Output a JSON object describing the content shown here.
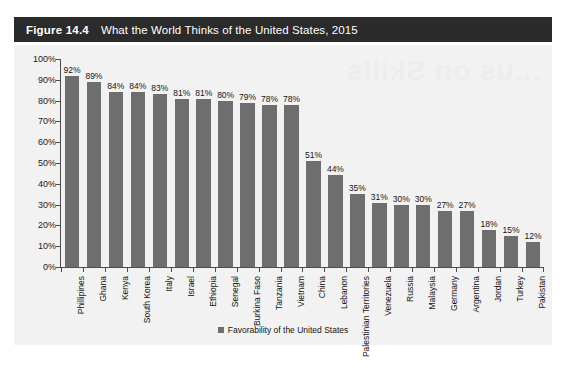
{
  "figure": {
    "number_label": "Figure 14.4",
    "title": "What the World Thinks of the United States, 2015"
  },
  "colors": {
    "header_background": "#2b2b2b",
    "header_text": "#ffffff",
    "chart_background": "#f2f2f2",
    "bar": "#6e6e6e",
    "axis": "#4d4d4d",
    "label_text": "#141414"
  },
  "legend": {
    "position": "bottom-center",
    "entries": [
      {
        "label": "Favorability of the United States",
        "color": "#6e6e6e",
        "marker": "square"
      }
    ]
  },
  "chart_data": {
    "type": "bar",
    "title": "What the World Thinks of the United States, 2015",
    "subtitle": "",
    "xlabel": "",
    "ylabel": "",
    "ylim": [
      0,
      100
    ],
    "ytick_labels": [
      "0%",
      "10%",
      "20%",
      "30%",
      "40%",
      "50%",
      "60%",
      "70%",
      "80%",
      "90%",
      "100%"
    ],
    "ytick_values": [
      0,
      10,
      20,
      30,
      40,
      50,
      60,
      70,
      80,
      90,
      100
    ],
    "grid": false,
    "legend_position": "bottom",
    "categories": [
      "Phillipines",
      "Ghana",
      "Kenya",
      "South Korea",
      "Italy",
      "Israel",
      "Ethiopia",
      "Senegal",
      "Burkina Faso",
      "Tanzania",
      "Vietnam",
      "China",
      "Lebanon",
      "Palestinian Territories",
      "Venezuela",
      "Russia",
      "Malaysia",
      "Germany",
      "Argentina",
      "Jordan",
      "Turkey",
      "Pakistan"
    ],
    "series": [
      {
        "name": "Favorability of the United States",
        "color": "#6e6e6e",
        "values": [
          92,
          89,
          84,
          84,
          83,
          81,
          81,
          80,
          79,
          78,
          78,
          51,
          44,
          35,
          31,
          30,
          30,
          27,
          27,
          18,
          15,
          12
        ]
      }
    ],
    "data_labels": [
      "92%",
      "89%",
      "84%",
      "84%",
      "83%",
      "81%",
      "81%",
      "80%",
      "79%",
      "78%",
      "78%",
      "51%",
      "44%",
      "35%",
      "31%",
      "30%",
      "30%",
      "27%",
      "27%",
      "18%",
      "15%",
      "12%"
    ]
  },
  "artifacts": {
    "bleed_through_line1": "...us on Skills",
    "bleed_through_line2": "",
    "clipped_source_line": ""
  }
}
